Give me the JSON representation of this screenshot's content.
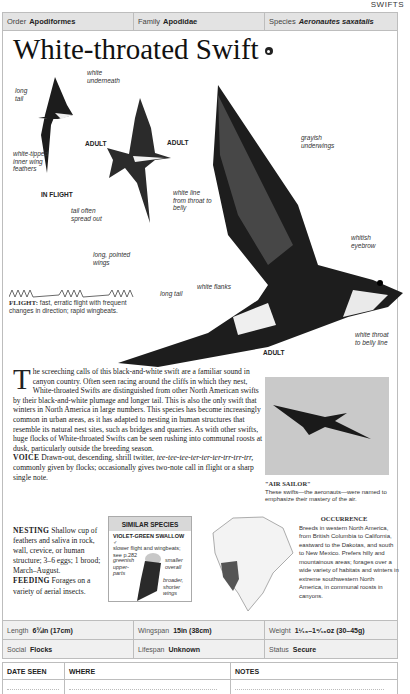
{
  "section": "SWIFTS",
  "taxonomy": {
    "order_label": "Order",
    "order": "Apodiformes",
    "family_label": "Family",
    "family": "Apodidae",
    "species_label": "Species",
    "species": "Aeronautes saxatalis"
  },
  "title": "White-throated Swift",
  "illustrations": {
    "in_flight_label": "IN FLIGHT",
    "adult_small_label": "ADULT",
    "adult_mid_label": "ADULT",
    "adult_main_label": "ADULT",
    "annotations": {
      "long_tail_1": "long tail",
      "white_underneath": "white underneath",
      "white_tipped": "white-tipped inner wing feathers",
      "white_line": "white line from throat to belly",
      "tail_spread": "tail often spread out",
      "long_wings": "long, pointed wings",
      "grayish_underwings": "grayish underwings",
      "whitish_eyebrow": "whitish eyebrow",
      "white_flanks": "white flanks",
      "long_tail_2": "long tail",
      "white_throat": "white throat to belly line"
    }
  },
  "flight": {
    "label": "FLIGHT:",
    "text": "fast, erratic flight with frequent changes in direction; rapid wingbeats."
  },
  "description": {
    "dropcap": "T",
    "text": "he screeching calls of this black-and-white swift are a familiar sound in canyon country. Often seen racing around the cliffs in which they nest, White-throated Swifts are distinguished from other North American swifts by their black-and-white plumage and longer tail. This is also the only swift that winters in North America in large numbers. This species has become increasingly common in urban areas, as it has adapted to nesting in human structures that resemble its natural nest sites, such as bridges and quarries. As with other swifts, huge flocks of White-throated Swifts can be seen rushing into communal roosts at dusk, particularly outside the breeding season.",
    "voice_label": "VOICE",
    "voice_text": "Drawn-out, descending, shrill twitter,",
    "voice_call": "tee-tee-tee-ter-ter-ter-trr-trr-trr,",
    "voice_text2": "commonly given by flocks; occasionally gives two-note call in flight or a sharp single note.",
    "nesting_label": "NESTING",
    "nesting_text": "Shallow cup of feathers and saliva in rock, wall, crevice, or human structure; 3–6 eggs; 1 brood; March–August.",
    "feeding_label": "FEEDING",
    "feeding_text": "Forages on a variety of aerial insects."
  },
  "similar_species": {
    "header": "SIMILAR SPECIES",
    "name": "VIOLET-GREEN SWALLOW ♂",
    "desc": "slower flight and wingbeats; see p.282",
    "notes": [
      "greenish upper-parts",
      "smaller overall",
      "broader, shorter wings"
    ]
  },
  "photo": {
    "caption_title": "\"AIR SAILOR\"",
    "caption_text": "These swifts—the aeronauts—were named to emphasize their mastery of the air."
  },
  "occurrence": {
    "title": "OCCURRENCE",
    "text": "Breeds in western North America, from British Columbia to California, eastward to the Dakotas, and south to New Mexico. Prefers hilly and mountainous areas; forages over a wide variety of habitats and winters in extreme southwestern North America, in communal roosts in canyons."
  },
  "stats": {
    "length_label": "Length",
    "length": "6¾in (17cm)",
    "wingspan_label": "Wingspan",
    "wingspan": "15in (38cm)",
    "weight_label": "Weight",
    "weight": "1¹⁄₁₆–1⁹⁄₁₆oz (30–45g)",
    "social_label": "Social",
    "social": "Flocks",
    "lifespan_label": "Lifespan",
    "lifespan": "Unknown",
    "status_label": "Status",
    "status": "Secure"
  },
  "log": {
    "columns": [
      "DATE SEEN",
      "WHERE",
      "NOTES"
    ]
  }
}
